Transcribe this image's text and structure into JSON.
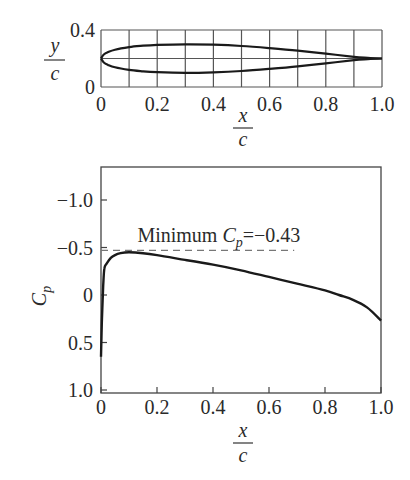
{
  "chart_data": [
    {
      "type": "line",
      "title": "",
      "subtitle": "Airfoil geometry",
      "xlabel": {
        "num": "x",
        "den": "c"
      },
      "ylabel": {
        "num": "y",
        "den": "c"
      },
      "xlim": [
        0,
        1.0
      ],
      "ylim": [
        0,
        0.4
      ],
      "grid": true,
      "grid_x_step": 0.1,
      "grid_y_step": 0.2,
      "xticks": [
        0,
        0.2,
        0.4,
        0.6,
        0.8,
        1.0
      ],
      "xtick_labels": [
        "0",
        "0.2",
        "0.4",
        "0.6",
        "0.8",
        "1.0"
      ],
      "yticks": [
        0,
        0.4
      ],
      "ytick_labels": [
        "0",
        "0.4"
      ],
      "series": [
        {
          "name": "upper surface",
          "x": [
            0,
            0.01,
            0.025,
            0.05,
            0.1,
            0.15,
            0.2,
            0.3,
            0.4,
            0.5,
            0.6,
            0.7,
            0.8,
            0.9,
            0.95,
            1.0
          ],
          "y": [
            0.2,
            0.228,
            0.245,
            0.262,
            0.28,
            0.29,
            0.296,
            0.3,
            0.297,
            0.288,
            0.273,
            0.255,
            0.234,
            0.212,
            0.205,
            0.2
          ]
        },
        {
          "name": "lower surface",
          "x": [
            0,
            0.01,
            0.025,
            0.05,
            0.1,
            0.15,
            0.2,
            0.3,
            0.4,
            0.5,
            0.6,
            0.7,
            0.8,
            0.9,
            0.95,
            1.0
          ],
          "y": [
            0.2,
            0.172,
            0.155,
            0.138,
            0.12,
            0.11,
            0.104,
            0.1,
            0.103,
            0.112,
            0.127,
            0.145,
            0.166,
            0.188,
            0.195,
            0.2
          ]
        }
      ]
    },
    {
      "type": "line",
      "title": "",
      "xlabel": {
        "num": "x",
        "den": "c"
      },
      "ylabel": {
        "main": "C",
        "sub": "p"
      },
      "xlim": [
        0,
        1.0
      ],
      "ylim": [
        1.0,
        -1.3
      ],
      "y_inverted": true,
      "grid": false,
      "xticks": [
        0,
        0.2,
        0.4,
        0.6,
        0.8,
        1.0
      ],
      "xtick_labels": [
        "0",
        "0.2",
        "0.4",
        "0.6",
        "0.8",
        "1.0"
      ],
      "yticks": [
        -1.0,
        -0.5,
        0,
        0.5,
        1.0
      ],
      "ytick_labels": [
        "−1.0",
        "−0.5",
        "0",
        "0.5",
        "1.0"
      ],
      "series": [
        {
          "name": "Cp distribution",
          "x": [
            0,
            0.003,
            0.008,
            0.012,
            0.02,
            0.035,
            0.05,
            0.07,
            0.1,
            0.15,
            0.2,
            0.3,
            0.4,
            0.5,
            0.6,
            0.7,
            0.8,
            0.85,
            0.9,
            0.95,
            1.0
          ],
          "y": [
            0.65,
            0.3,
            -0.1,
            -0.28,
            -0.33,
            -0.39,
            -0.42,
            -0.44,
            -0.45,
            -0.44,
            -0.42,
            -0.37,
            -0.32,
            -0.26,
            -0.19,
            -0.12,
            -0.05,
            0.0,
            0.05,
            0.13,
            0.27
          ]
        }
      ],
      "annotations": [
        {
          "text_main": "Minimum ",
          "text_sym": "C",
          "text_sub": "p",
          "text_tail": "=−0.43",
          "x": 0.13,
          "y": -0.62
        }
      ],
      "reference_lines": [
        {
          "style": "dashed",
          "y": -0.47,
          "x_from": 0,
          "x_to": 0.69
        }
      ]
    }
  ],
  "colors": {
    "line": "#1a1a1a",
    "grid": "#555555",
    "axis": "#444444",
    "dashed": "#777777",
    "text": "#2a2a2a"
  }
}
